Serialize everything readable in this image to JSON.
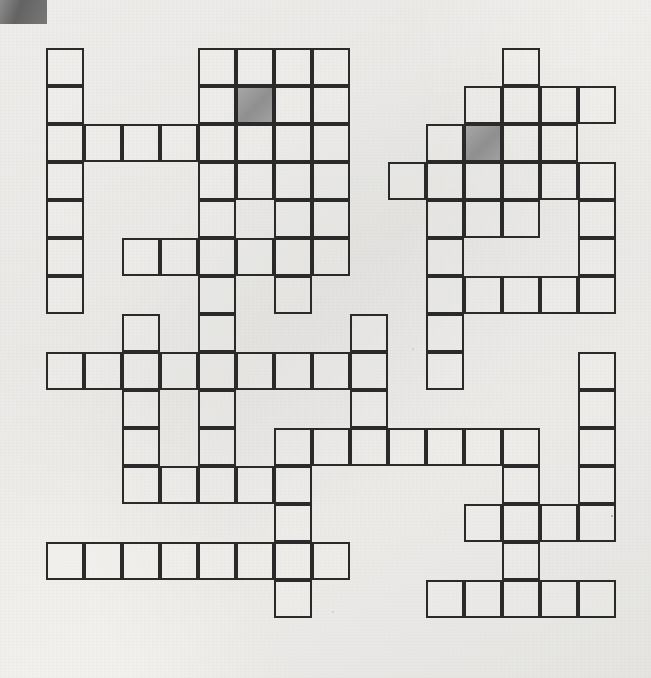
{
  "page": {
    "type": "crossword-grid",
    "background_color": "#f1efec",
    "line_color": "#2a2a2a",
    "shaded_cell_color": "#9a9a9a",
    "corner_swatch_color": "#6e6e6e"
  },
  "grid": {
    "columns": 15,
    "rows": [
      {
        "row": 0,
        "cols": [
          0,
          4,
          5,
          6,
          7,
          12
        ]
      },
      {
        "row": 1,
        "cols": [
          0,
          4,
          5,
          6,
          7,
          11,
          12,
          13,
          14
        ]
      },
      {
        "row": 2,
        "cols": [
          0,
          1,
          2,
          3,
          4,
          5,
          6,
          7,
          10,
          11,
          12,
          13
        ]
      },
      {
        "row": 3,
        "cols": [
          0,
          4,
          5,
          6,
          7,
          9,
          10,
          11,
          12,
          13,
          14
        ]
      },
      {
        "row": 4,
        "cols": [
          0,
          4,
          6,
          7,
          10,
          11,
          12,
          14
        ]
      },
      {
        "row": 5,
        "cols": [
          0,
          2,
          3,
          4,
          5,
          6,
          7,
          10,
          14
        ]
      },
      {
        "row": 6,
        "cols": [
          0,
          4,
          6,
          10,
          11,
          12,
          13,
          14
        ]
      },
      {
        "row": 7,
        "cols": [
          2,
          4,
          8,
          10
        ]
      },
      {
        "row": 8,
        "cols": [
          0,
          1,
          2,
          3,
          4,
          5,
          6,
          7,
          8,
          10,
          14
        ]
      },
      {
        "row": 9,
        "cols": [
          2,
          4,
          8,
          14
        ]
      },
      {
        "row": 10,
        "cols": [
          2,
          4,
          6,
          7,
          8,
          9,
          10,
          11,
          12,
          14
        ]
      },
      {
        "row": 11,
        "cols": [
          2,
          3,
          4,
          5,
          6,
          12,
          14
        ]
      },
      {
        "row": 12,
        "cols": [
          6,
          11,
          12,
          13,
          14
        ]
      },
      {
        "row": 13,
        "cols": [
          0,
          1,
          2,
          3,
          4,
          5,
          6,
          7,
          12
        ]
      },
      {
        "row": 14,
        "cols": [
          6,
          10,
          11,
          12,
          13,
          14
        ]
      },
      {
        "row": 15,
        "cols": []
      }
    ],
    "cell_size": 38,
    "origin_x": 46,
    "origin_y": 48,
    "filled_cells_note": "rows listed as arrays of active column indices (0-based)",
    "shaded_cells": [
      {
        "row": 1,
        "col": 5
      },
      {
        "row": 2,
        "col": 11
      }
    ]
  }
}
